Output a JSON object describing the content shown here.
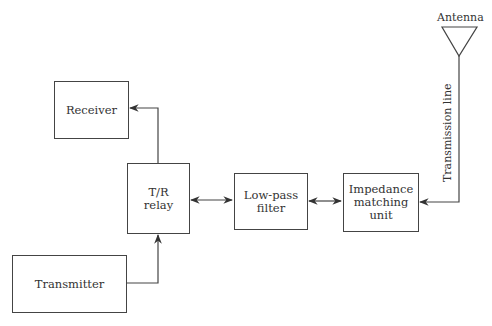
{
  "diagram": {
    "title": "",
    "blocks": {
      "receiver": {
        "label": "Receiver"
      },
      "tr_relay": {
        "label_line1": "T/R",
        "label_line2": "relay"
      },
      "transmitter": {
        "label": "Transmitter"
      },
      "low_pass_filter": {
        "label_line1": "Low-pass",
        "label_line2": "filter"
      },
      "impedance_matching": {
        "label_line1": "Impedance",
        "label_line2": "matching",
        "label_line3": "unit"
      }
    },
    "antenna": {
      "label": "Antenna"
    },
    "transmission_line": {
      "label": "Transmission line"
    },
    "connections": [
      {
        "from": "T/R relay",
        "to": "Receiver",
        "type": "one-way"
      },
      {
        "from": "Transmitter",
        "to": "T/R relay",
        "type": "one-way"
      },
      {
        "from": "T/R relay",
        "to": "Low-pass filter",
        "type": "two-way"
      },
      {
        "from": "Low-pass filter",
        "to": "Impedance matching unit",
        "type": "two-way"
      },
      {
        "from": "Antenna",
        "to": "Impedance matching unit",
        "type": "one-way",
        "via": "Transmission line"
      }
    ],
    "colors": {
      "line": "#444444",
      "text": "#333333",
      "background": "#ffffff"
    }
  }
}
